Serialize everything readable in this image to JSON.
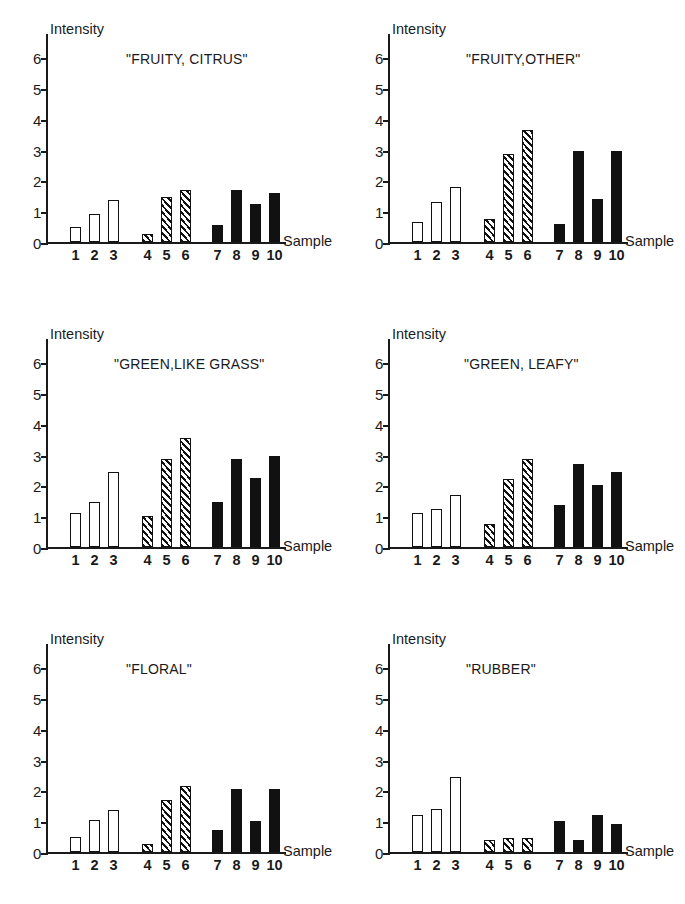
{
  "figure": {
    "axis_y_label": "Intensity",
    "axis_x_label": "Sample",
    "y_ticks": [
      "0",
      "1",
      "2",
      "3",
      "4",
      "5",
      "6"
    ],
    "x_ticks": [
      "1",
      "2",
      "3",
      "4",
      "5",
      "6",
      "7",
      "8",
      "9",
      "10"
    ],
    "ink_color": "#111111",
    "background_color": "#ffffff"
  },
  "panels": [
    {
      "title": "\"FRUITY, CITRUS\""
    },
    {
      "title": "\"FRUITY,OTHER\""
    },
    {
      "title": "\"GREEN,LIKE GRASS\""
    },
    {
      "title": "\"GREEN, LEAFY\""
    },
    {
      "title": "\"FLORAL\""
    },
    {
      "title": "\"RUBBER\""
    }
  ],
  "chart_data": [
    {
      "type": "bar",
      "title": "\"FRUITY, CITRUS\"",
      "xlabel": "Sample",
      "ylabel": "Intensity",
      "ylim": [
        0,
        6.6
      ],
      "yticks": [
        0,
        1,
        2,
        3,
        4,
        5,
        6
      ],
      "grid": false,
      "legend": null,
      "categories": [
        "1",
        "2",
        "3",
        "4",
        "5",
        "6",
        "7",
        "8",
        "9",
        "10"
      ],
      "values": [
        0.5,
        0.9,
        1.35,
        0.25,
        1.45,
        1.7,
        0.55,
        1.7,
        1.25,
        1.6
      ],
      "bar_styles": [
        "open",
        "open",
        "open",
        "hatch",
        "hatch",
        "hatch",
        "solid",
        "solid",
        "solid",
        "solid"
      ]
    },
    {
      "type": "bar",
      "title": "\"FRUITY,OTHER\"",
      "xlabel": "Sample",
      "ylabel": "Intensity",
      "ylim": [
        0,
        6.6
      ],
      "yticks": [
        0,
        1,
        2,
        3,
        4,
        5,
        6
      ],
      "grid": false,
      "legend": null,
      "categories": [
        "1",
        "2",
        "3",
        "4",
        "5",
        "6",
        "7",
        "8",
        "9",
        "10"
      ],
      "values": [
        0.65,
        1.3,
        1.8,
        0.75,
        2.85,
        3.65,
        0.6,
        2.95,
        1.4,
        2.95
      ],
      "bar_styles": [
        "open",
        "open",
        "open",
        "hatch",
        "hatch",
        "hatch",
        "solid",
        "solid",
        "solid",
        "solid"
      ]
    },
    {
      "type": "bar",
      "title": "\"GREEN,LIKE GRASS\"",
      "xlabel": "Sample",
      "ylabel": "Intensity",
      "ylim": [
        0,
        6.6
      ],
      "yticks": [
        0,
        1,
        2,
        3,
        4,
        5,
        6
      ],
      "grid": false,
      "legend": null,
      "categories": [
        "1",
        "2",
        "3",
        "4",
        "5",
        "6",
        "7",
        "8",
        "9",
        "10"
      ],
      "values": [
        1.1,
        1.45,
        2.45,
        1.0,
        2.85,
        3.55,
        1.45,
        2.85,
        2.25,
        2.95
      ],
      "bar_styles": [
        "open",
        "open",
        "open",
        "hatch",
        "hatch",
        "hatch",
        "solid",
        "solid",
        "solid",
        "solid"
      ]
    },
    {
      "type": "bar",
      "title": "\"GREEN, LEAFY\"",
      "xlabel": "Sample",
      "ylabel": "Intensity",
      "ylim": [
        0,
        6.6
      ],
      "yticks": [
        0,
        1,
        2,
        3,
        4,
        5,
        6
      ],
      "grid": false,
      "legend": null,
      "categories": [
        "1",
        "2",
        "3",
        "4",
        "5",
        "6",
        "7",
        "8",
        "9",
        "10"
      ],
      "values": [
        1.1,
        1.25,
        1.7,
        0.75,
        2.2,
        2.85,
        1.35,
        2.7,
        2.0,
        2.45
      ],
      "bar_styles": [
        "open",
        "open",
        "open",
        "hatch",
        "hatch",
        "hatch",
        "solid",
        "solid",
        "solid",
        "solid"
      ]
    },
    {
      "type": "bar",
      "title": "\"FLORAL\"",
      "xlabel": "Sample",
      "ylabel": "Intensity",
      "ylim": [
        0,
        6.6
      ],
      "yticks": [
        0,
        1,
        2,
        3,
        4,
        5,
        6
      ],
      "grid": false,
      "legend": null,
      "categories": [
        "1",
        "2",
        "3",
        "4",
        "5",
        "6",
        "7",
        "8",
        "9",
        "10"
      ],
      "values": [
        0.5,
        1.05,
        1.35,
        0.25,
        1.7,
        2.15,
        0.7,
        2.05,
        1.0,
        2.05
      ],
      "bar_styles": [
        "open",
        "open",
        "open",
        "hatch",
        "hatch",
        "hatch",
        "solid",
        "solid",
        "solid",
        "solid"
      ]
    },
    {
      "type": "bar",
      "title": "\"RUBBER\"",
      "xlabel": "Sample",
      "ylabel": "Intensity",
      "ylim": [
        0,
        6.6
      ],
      "yticks": [
        0,
        1,
        2,
        3,
        4,
        5,
        6
      ],
      "grid": false,
      "legend": null,
      "categories": [
        "1",
        "2",
        "3",
        "4",
        "5",
        "6",
        "7",
        "8",
        "9",
        "10"
      ],
      "values": [
        1.2,
        1.4,
        2.45,
        0.4,
        0.45,
        0.45,
        1.0,
        0.4,
        1.2,
        0.9
      ],
      "bar_styles": [
        "open",
        "open",
        "open",
        "hatch",
        "hatch",
        "hatch",
        "solid",
        "solid",
        "solid",
        "solid"
      ]
    }
  ],
  "layout": {
    "title_left_offsets_px": [
      30,
      28,
      18,
      26,
      30,
      28
    ],
    "bar_x_positions_px": [
      22,
      41,
      60,
      94,
      113,
      132,
      164,
      183,
      202,
      221
    ]
  }
}
